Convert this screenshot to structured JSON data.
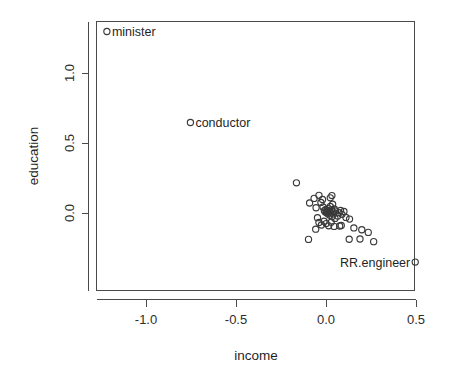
{
  "chart_data": {
    "type": "scatter",
    "title": "",
    "xlabel": "income",
    "ylabel": "education",
    "xlim": [
      -1.33,
      0.555
    ],
    "ylim": [
      -0.43,
      1.36
    ],
    "xticks": [
      -1.0,
      -0.5,
      0.0,
      0.5
    ],
    "xticklabels": [
      "-1.0",
      "-0.5",
      "0.0",
      "0.5"
    ],
    "yticks": [
      0.0,
      0.5,
      1.0
    ],
    "yticklabels": [
      "0.0",
      "0.5",
      "1.0"
    ],
    "grid": false,
    "legend": null,
    "marker": "open-circle",
    "marker_color": "#3a3a3a",
    "annotations": [
      {
        "label": "minister",
        "x": -1.22,
        "y": 1.3,
        "anchor": "right-of-point"
      },
      {
        "label": "conductor",
        "x": -0.756,
        "y": 0.65,
        "anchor": "right-of-point"
      },
      {
        "label": "RR.engineer",
        "x": 0.493,
        "y": -0.347,
        "anchor": "left-of-point"
      }
    ],
    "points": [
      {
        "x": -1.22,
        "y": 1.3,
        "label": "minister"
      },
      {
        "x": -0.756,
        "y": 0.65,
        "label": "conductor"
      },
      {
        "x": 0.493,
        "y": -0.347,
        "label": "RR.engineer"
      },
      {
        "x": -0.167,
        "y": 0.219,
        "label": ""
      },
      {
        "x": -0.094,
        "y": 0.075,
        "label": ""
      },
      {
        "x": -0.069,
        "y": 0.108,
        "label": ""
      },
      {
        "x": -0.058,
        "y": 0.041,
        "label": ""
      },
      {
        "x": -0.042,
        "y": 0.13,
        "label": ""
      },
      {
        "x": -0.031,
        "y": 0.079,
        "label": ""
      },
      {
        "x": -0.022,
        "y": 0.1,
        "label": ""
      },
      {
        "x": -0.019,
        "y": 0.047,
        "label": ""
      },
      {
        "x": -0.012,
        "y": 0.021,
        "label": ""
      },
      {
        "x": -0.008,
        "y": 0.012,
        "label": ""
      },
      {
        "x": -0.004,
        "y": 0.03,
        "label": ""
      },
      {
        "x": 0.0,
        "y": 0.006,
        "label": ""
      },
      {
        "x": 0.004,
        "y": 0.022,
        "label": ""
      },
      {
        "x": 0.008,
        "y": -0.002,
        "label": ""
      },
      {
        "x": 0.011,
        "y": 0.035,
        "label": ""
      },
      {
        "x": 0.015,
        "y": 0.014,
        "label": ""
      },
      {
        "x": 0.018,
        "y": -0.012,
        "label": ""
      },
      {
        "x": 0.021,
        "y": 0.05,
        "label": ""
      },
      {
        "x": 0.024,
        "y": 0.004,
        "label": ""
      },
      {
        "x": 0.028,
        "y": 0.026,
        "label": ""
      },
      {
        "x": 0.031,
        "y": -0.022,
        "label": ""
      },
      {
        "x": 0.034,
        "y": 0.066,
        "label": ""
      },
      {
        "x": 0.036,
        "y": 0.012,
        "label": ""
      },
      {
        "x": 0.04,
        "y": -0.004,
        "label": ""
      },
      {
        "x": 0.043,
        "y": 0.032,
        "label": ""
      },
      {
        "x": 0.047,
        "y": -0.035,
        "label": ""
      },
      {
        "x": 0.05,
        "y": 0.018,
        "label": ""
      },
      {
        "x": 0.021,
        "y": 0.112,
        "label": ""
      },
      {
        "x": 0.03,
        "y": 0.128,
        "label": ""
      },
      {
        "x": -0.05,
        "y": -0.03,
        "label": ""
      },
      {
        "x": -0.042,
        "y": -0.064,
        "label": ""
      },
      {
        "x": -0.028,
        "y": -0.082,
        "label": ""
      },
      {
        "x": -0.014,
        "y": -0.055,
        "label": ""
      },
      {
        "x": -0.002,
        "y": -0.072,
        "label": ""
      },
      {
        "x": 0.012,
        "y": -0.088,
        "label": ""
      },
      {
        "x": 0.026,
        "y": -0.062,
        "label": ""
      },
      {
        "x": 0.042,
        "y": -0.092,
        "label": ""
      },
      {
        "x": 0.062,
        "y": -0.018,
        "label": ""
      },
      {
        "x": 0.07,
        "y": 0.006,
        "label": ""
      },
      {
        "x": 0.078,
        "y": 0.022,
        "label": ""
      },
      {
        "x": 0.086,
        "y": -0.006,
        "label": ""
      },
      {
        "x": 0.097,
        "y": 0.014,
        "label": ""
      },
      {
        "x": 0.108,
        "y": -0.028,
        "label": ""
      },
      {
        "x": 0.128,
        "y": -0.04,
        "label": ""
      },
      {
        "x": 0.073,
        "y": -0.089,
        "label": ""
      },
      {
        "x": 0.082,
        "y": -0.086,
        "label": ""
      },
      {
        "x": 0.152,
        "y": -0.103,
        "label": ""
      },
      {
        "x": 0.196,
        "y": -0.116,
        "label": ""
      },
      {
        "x": 0.232,
        "y": -0.135,
        "label": ""
      },
      {
        "x": 0.126,
        "y": -0.184,
        "label": ""
      },
      {
        "x": 0.186,
        "y": -0.182,
        "label": ""
      },
      {
        "x": 0.262,
        "y": -0.201,
        "label": ""
      },
      {
        "x": -0.1,
        "y": -0.185,
        "label": ""
      },
      {
        "x": -0.06,
        "y": -0.112,
        "label": ""
      }
    ]
  },
  "axes": {
    "x_title": "income",
    "y_title": "education"
  }
}
